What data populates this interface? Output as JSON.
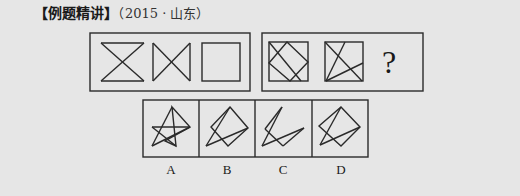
{
  "header": {
    "title": "【例题精讲】",
    "source": "（2015 · 山东）"
  },
  "question": {
    "sequence_label": "Figure sequence",
    "unknown_marker": "?",
    "figures": [
      "hourglass-shape",
      "bowtie-shape",
      "square",
      "square-with-inscribed-rectangle-and-diagonal",
      "square-with-fan-lines"
    ]
  },
  "options": [
    {
      "label": "A"
    },
    {
      "label": "B"
    },
    {
      "label": "C"
    },
    {
      "label": "D"
    }
  ],
  "colors": {
    "background": "#e6e6e6",
    "stroke": "#2a2a2a"
  }
}
